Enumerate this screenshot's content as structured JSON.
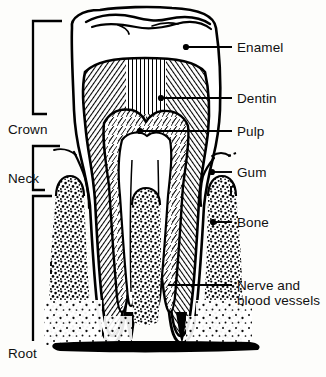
{
  "figure": {
    "colors": {
      "ink": "#000000",
      "paper": "#fdfdfb",
      "enamel_fill": "#ffffff",
      "dentin_hatch": "#000000",
      "pulp_fill": "#ffffff",
      "bone_stipple": "#000000",
      "base_bar": "#000000"
    }
  },
  "right_labels": [
    {
      "id": "enamel",
      "text": "Enamel",
      "x": 237,
      "y": 52,
      "leader_from_x": 232,
      "leader_to_x": 186,
      "dot_x": 186,
      "dot_y": 47
    },
    {
      "id": "dentin",
      "text": "Dentin",
      "x": 237,
      "y": 103,
      "leader_from_x": 232,
      "leader_to_x": 161,
      "dot_x": 161,
      "dot_y": 98
    },
    {
      "id": "pulp",
      "text": "Pulp",
      "x": 237,
      "y": 136,
      "leader_from_x": 232,
      "leader_to_x": 140,
      "dot_x": 140,
      "dot_y": 131
    },
    {
      "id": "gum",
      "text": "Gum",
      "x": 237,
      "y": 177,
      "leader_from_x": 232,
      "leader_to_x": 212,
      "dot_x": 212,
      "dot_y": 172
    },
    {
      "id": "bone",
      "text": "Bone",
      "x": 237,
      "y": 227,
      "leader_from_x": 232,
      "leader_to_x": 213,
      "dot_x": 213,
      "dot_y": 222
    }
  ],
  "nerve_label": {
    "id": "nerve-and-blood-vessels",
    "line1": "Nerve and",
    "line2": "blood vessels",
    "x": 237,
    "y1": 290,
    "y2": 305,
    "leader_from_x": 232,
    "leader_to_x": 168,
    "leader_y": 285
  },
  "left_labels": [
    {
      "id": "crown",
      "text": "Crown",
      "x": 8,
      "y": 134,
      "bracket_top": 21,
      "bracket_bottom": 114,
      "bracket_x": 33,
      "bracket_tip": 62
    },
    {
      "id": "neck",
      "text": "Neck",
      "x": 8,
      "y": 183,
      "bracket_top": 146,
      "bracket_bottom": 190,
      "bracket_x": 33,
      "bracket_tip": 62
    },
    {
      "id": "root",
      "text": "Root",
      "x": 8,
      "y": 358,
      "bracket_top": 196,
      "bracket_bottom": 341,
      "bracket_x": 33,
      "bracket_tip": 62
    }
  ]
}
